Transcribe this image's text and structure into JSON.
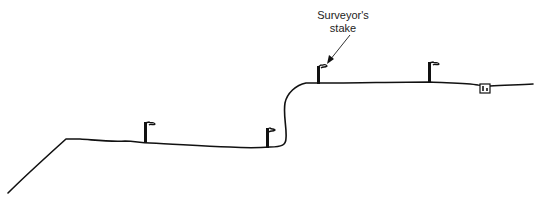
{
  "diagram": {
    "type": "terrain-profile",
    "annotation": {
      "line1": "Surveyor's",
      "line2": "stake"
    },
    "colors": {
      "ink": "#111111",
      "background": "#ffffff"
    },
    "stakes": [
      {
        "id": "stake-1",
        "x": 146,
        "base_y": 142
      },
      {
        "id": "stake-2",
        "x": 268,
        "base_y": 147
      },
      {
        "id": "stake-3",
        "x": 319,
        "base_y": 83
      },
      {
        "id": "stake-4",
        "x": 430,
        "base_y": 82
      }
    ],
    "benchmark": {
      "x": 480,
      "y": 83
    }
  }
}
